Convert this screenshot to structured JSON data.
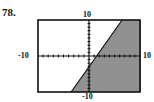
{
  "problem": {
    "number": "78."
  },
  "chart_data": {
    "type": "area",
    "title": "",
    "inequality": "y <= 2x - 3",
    "boundary": {
      "slope": 2,
      "intercept": -3,
      "style": "solid"
    },
    "shaded_side": "below",
    "xlim": [
      -10,
      10
    ],
    "ylim": [
      -10,
      10
    ],
    "xscl": 1,
    "yscl": 1,
    "tick_labels": {
      "xmin": "-10",
      "xmax": "10",
      "ymin": "-10",
      "ymax": "10"
    },
    "grid": false,
    "colors": {
      "frame": "#111111",
      "shade": "#222222",
      "background": "#ffffff"
    }
  }
}
